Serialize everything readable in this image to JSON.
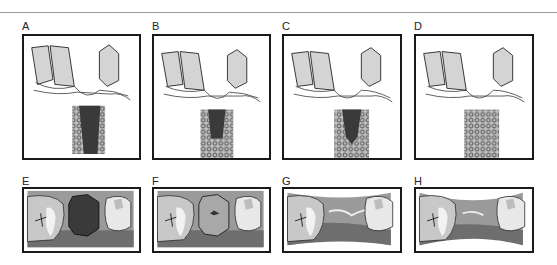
{
  "figure": {
    "top_row": [
      {
        "label": "A",
        "description": "extraction socket, empty (blood clot)"
      },
      {
        "label": "B",
        "description": "socket with narrower clot, early bone"
      },
      {
        "label": "C",
        "description": "socket partially filled with bone"
      },
      {
        "label": "D",
        "description": "socket completely filled with bone"
      }
    ],
    "bottom_row": [
      {
        "label": "E",
        "description": "occlusal view, dark clot in socket"
      },
      {
        "label": "F",
        "description": "occlusal view, socket covered with tissue"
      },
      {
        "label": "G",
        "description": "occlusal view, ridge collapsing"
      },
      {
        "label": "H",
        "description": "occlusal view, ridge narrowed"
      }
    ],
    "colors": {
      "tooth": "#d4d4d4",
      "clot": "#3a3a3a",
      "bone": "#8a8a8a",
      "gum": "#9a9a9a",
      "frame": "#1a1a1a"
    }
  }
}
